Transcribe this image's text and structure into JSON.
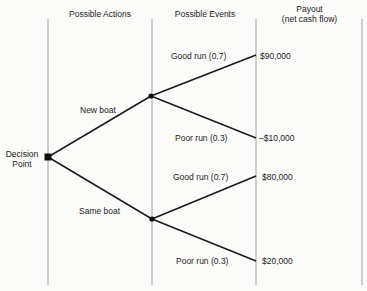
{
  "headers": {
    "actions": "Possible Actions",
    "events": "Possible Events",
    "payout_line1": "Payout",
    "payout_line2": "(net cash flow)"
  },
  "decision_node": {
    "line1": "Decision",
    "line2": "Point"
  },
  "actions": [
    {
      "label": "New boat"
    },
    {
      "label": "Same boat"
    }
  ],
  "events": [
    {
      "label": "Good run (0.7)",
      "payout": "$90,000"
    },
    {
      "label": "Poor run (0.3)",
      "payout": "–$10,000"
    },
    {
      "label": "Good run (0.7)",
      "payout": "$80,000"
    },
    {
      "label": "Poor run (0.3)",
      "payout": "$20,000"
    }
  ],
  "colors": {
    "line": "#1a1a1a",
    "guide": "#8a8a8a",
    "background": "#fbfbfa"
  }
}
